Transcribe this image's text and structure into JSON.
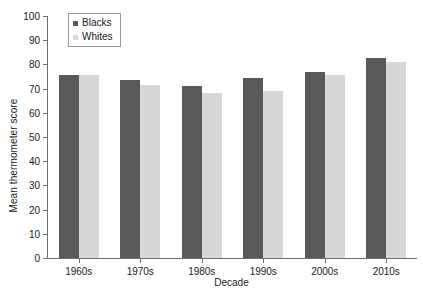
{
  "chart_data": {
    "type": "bar",
    "title": "",
    "xlabel": "Decade",
    "ylabel": "Mean thermometer score",
    "categories": [
      "1960s",
      "1970s",
      "1980s",
      "1990s",
      "2000s",
      "2010s"
    ],
    "series": [
      {
        "name": "Blacks",
        "color": "#595959",
        "values": [
          75.5,
          73.5,
          71.0,
          74.5,
          77.0,
          82.5
        ]
      },
      {
        "name": "Whites",
        "color": "#d8d8d8",
        "values": [
          75.5,
          71.5,
          68.0,
          69.0,
          75.5,
          81.0
        ]
      }
    ],
    "ylim": [
      0,
      100
    ],
    "ytick_step": 10,
    "yticks": [
      100,
      90,
      80,
      70,
      60,
      50,
      40,
      30,
      20,
      10,
      0
    ],
    "grid": false,
    "legend_position": "top-left",
    "axis_color": "#6e6e6e",
    "background_color": "#ffffff"
  }
}
